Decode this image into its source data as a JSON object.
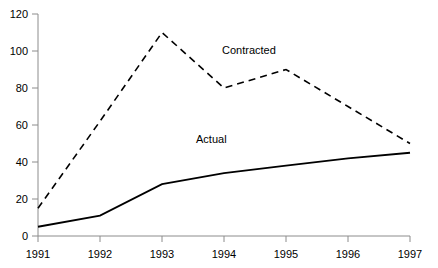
{
  "chart_data": {
    "type": "line",
    "title": "",
    "subtitle": "",
    "xlabel": "",
    "ylabel": "",
    "categories": [
      "1991",
      "1992",
      "1993",
      "1994",
      "1995",
      "1996",
      "1997"
    ],
    "x": [
      1991,
      1992,
      1993,
      1994,
      1995,
      1996,
      1997
    ],
    "xlim": [
      1991,
      1997
    ],
    "ylim": [
      0,
      120
    ],
    "y_ticks": [
      0,
      20,
      40,
      60,
      80,
      100,
      120
    ],
    "x_ticks": [
      "1991",
      "1992",
      "1993",
      "1994",
      "1995",
      "1996",
      "1997"
    ],
    "grid": false,
    "legend_position": "inline-annotation",
    "series": [
      {
        "name": "Contracted",
        "style": "dashed",
        "color": "#000000",
        "values": [
          15,
          62,
          110,
          80,
          90,
          70,
          50
        ],
        "label_text": "Contracted"
      },
      {
        "name": "Actual",
        "style": "solid",
        "color": "#000000",
        "values": [
          5,
          11,
          28,
          34,
          38,
          42,
          45
        ],
        "label_text": "Actual"
      }
    ],
    "annotations": [
      {
        "text": "Contracted",
        "x_px": 222,
        "y_px": 45
      },
      {
        "text": "Actual",
        "x_px": 196,
        "y_px": 134
      }
    ]
  },
  "axes": {
    "y_labels": [
      "120",
      "100",
      "80",
      "60",
      "40",
      "20",
      "0"
    ],
    "x_labels": [
      "1991",
      "1992",
      "1993",
      "1994",
      "1995",
      "1996",
      "1997"
    ],
    "axis_color": "#808080"
  },
  "colors": {
    "background": "#ffffff",
    "line": "#1a1a1a",
    "axis": "#8c8c8c",
    "text": "#000000"
  }
}
